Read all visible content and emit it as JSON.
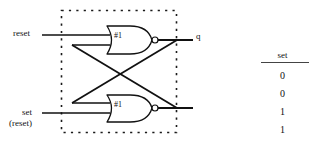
{
  "figure": {
    "kind": "logic-schematic",
    "title": "",
    "background_color": "#ffffff",
    "line_color": "#111111",
    "dashed_box_color": "#1a1a1a"
  },
  "schematic": {
    "inputs": [
      {
        "name": "reset-input",
        "label": "reset"
      },
      {
        "name": "set-input",
        "label": "set",
        "sublabel": "(reset)"
      }
    ],
    "outputs": [
      {
        "name": "q-output",
        "label": "q"
      },
      {
        "name": "qbar-output",
        "label": ""
      }
    ],
    "gates": [
      {
        "name": "nor-gate-top",
        "label": "#1",
        "type": "NOR"
      },
      {
        "name": "nor-gate-bottom",
        "label": "#1",
        "type": "NOR"
      }
    ]
  },
  "truth_table": {
    "header": "set",
    "rows": [
      "0",
      "0",
      "1",
      "1"
    ]
  }
}
